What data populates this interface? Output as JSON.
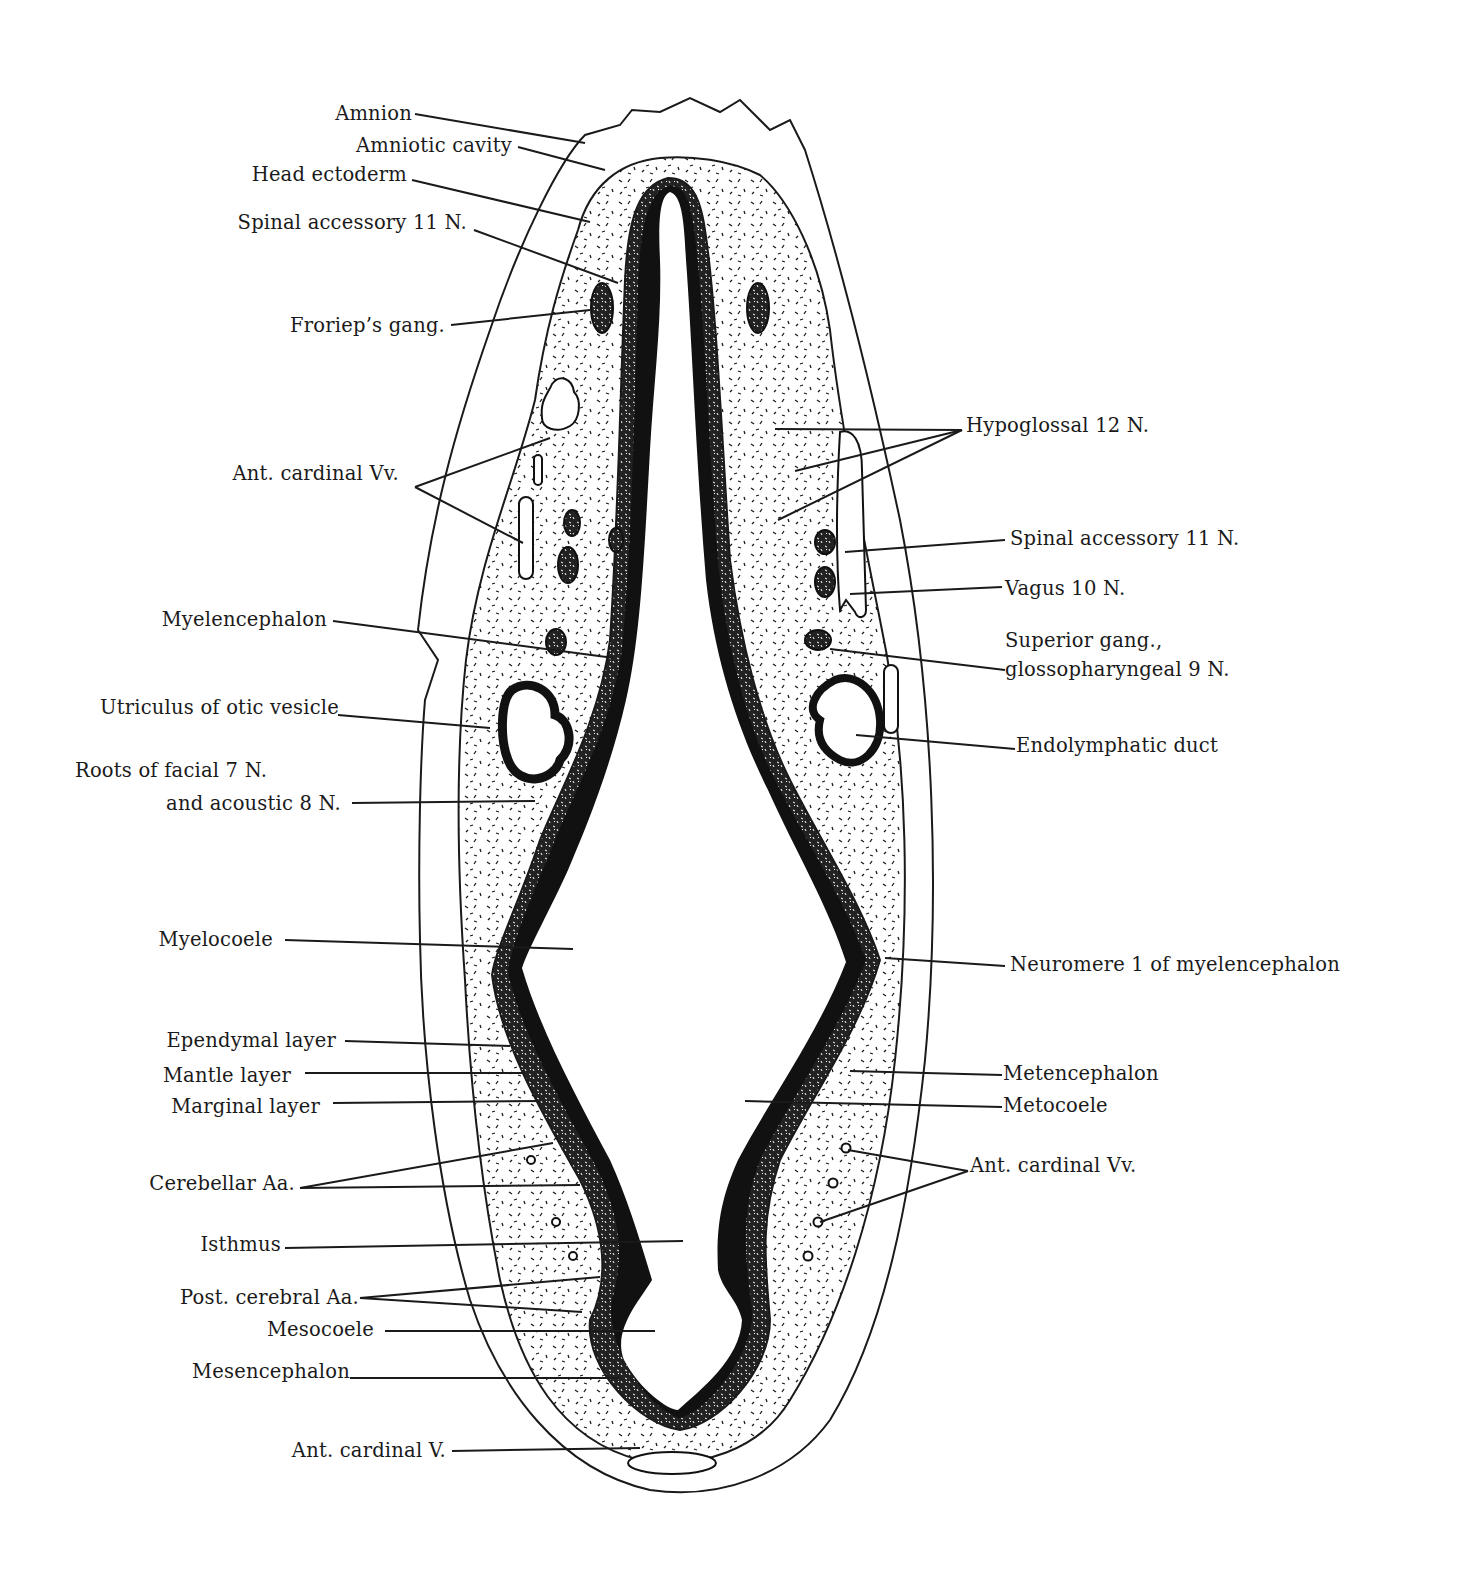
{
  "figure": {
    "colors": {
      "ink": "#1a1a1a",
      "background": "#ffffff",
      "neural_tube": "#111111"
    }
  },
  "labels_left": [
    {
      "id": "amnion",
      "text": "Amnion"
    },
    {
      "id": "amniotic-cavity",
      "text": "Amniotic cavity"
    },
    {
      "id": "head-ectoderm",
      "text": "Head ectoderm"
    },
    {
      "id": "spinal-accessory-left",
      "text": "Spinal accessory 11 N."
    },
    {
      "id": "frorieps-gang",
      "text": "Froriep’s gang."
    },
    {
      "id": "ant-cardinal-vv-left",
      "text": "Ant. cardinal Vv."
    },
    {
      "id": "myelencephalon",
      "text": "Myelencephalon"
    },
    {
      "id": "utriculus",
      "text": "Utriculus of otic vesicle"
    },
    {
      "id": "roots-facial-1",
      "text": "Roots of facial 7 N."
    },
    {
      "id": "roots-facial-2",
      "text": "and acoustic 8 N."
    },
    {
      "id": "myelocoele",
      "text": "Myelocoele"
    },
    {
      "id": "ependymal",
      "text": "Ependymal layer"
    },
    {
      "id": "mantle",
      "text": "Mantle layer"
    },
    {
      "id": "marginal",
      "text": "Marginal layer"
    },
    {
      "id": "cerebellar-aa",
      "text": "Cerebellar Aa."
    },
    {
      "id": "isthmus",
      "text": "Isthmus"
    },
    {
      "id": "post-cerebral-aa",
      "text": "Post. cerebral Aa."
    },
    {
      "id": "mesocoele",
      "text": "Mesocoele"
    },
    {
      "id": "mesencephalon",
      "text": "Mesencephalon"
    },
    {
      "id": "ant-cardinal-v",
      "text": "Ant. cardinal V."
    }
  ],
  "labels_right": [
    {
      "id": "hypoglossal",
      "text": "Hypoglossal 12 N."
    },
    {
      "id": "spinal-accessory-right",
      "text": "Spinal accessory 11 N."
    },
    {
      "id": "vagus",
      "text": "Vagus 10 N."
    },
    {
      "id": "superior-gang-1",
      "text": "Superior gang.,"
    },
    {
      "id": "superior-gang-2",
      "text": "glossopharyngeal 9 N."
    },
    {
      "id": "endolymphatic",
      "text": "Endolymphatic duct"
    },
    {
      "id": "neuromere",
      "text": "Neuromere 1 of myelencephalon"
    },
    {
      "id": "metencephalon",
      "text": "Metencephalon"
    },
    {
      "id": "metocoele",
      "text": "Metocoele"
    },
    {
      "id": "ant-cardinal-vv-right",
      "text": "Ant. cardinal Vv."
    }
  ]
}
